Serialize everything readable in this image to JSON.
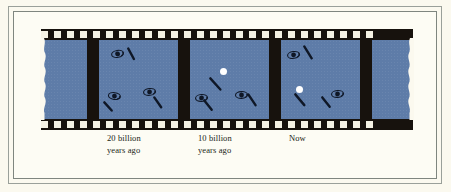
{
  "figure": {
    "background_color": "#fbf9ef",
    "border_color": "#7f867f",
    "film_color": "#17120d",
    "frame_color": "#5e7ca8",
    "sprocket_color": "#f5f2e4",
    "highlight_color": "#ffffff",
    "galaxy_color": "#0f1726",
    "type": "film-strip-illustration"
  },
  "captions": [
    {
      "id": "caption-20-billion",
      "text": "20 billion\nyears ago",
      "frame": 2
    },
    {
      "id": "caption-10-billion",
      "text": "10 billion\nyears ago",
      "frame": 3
    },
    {
      "id": "caption-now",
      "text": "Now",
      "frame": 4
    }
  ],
  "film": {
    "sprocket_count_top": 26,
    "sprocket_count_bottom": 26,
    "frame_count_visible": 4,
    "left_edge": "torn",
    "right_edge": "torn"
  },
  "frames": [
    {
      "index": 1,
      "label": "partial-left-frame",
      "objects": []
    },
    {
      "index": 2,
      "label": "20 billion years ago",
      "objects": [
        {
          "type": "spiral-galaxy",
          "x": 12,
          "y": 9,
          "rotation": -10
        },
        {
          "type": "motion-streak",
          "x": 29,
          "y": 6,
          "rotation": 62,
          "length": 13
        },
        {
          "type": "spiral-galaxy",
          "x": 9,
          "y": 51,
          "rotation": 8
        },
        {
          "type": "motion-streak",
          "x": 5,
          "y": 60,
          "rotation": 48,
          "length": 12
        },
        {
          "type": "spiral-galaxy",
          "x": 44,
          "y": 47,
          "rotation": -6
        },
        {
          "type": "motion-streak",
          "x": 55,
          "y": 55,
          "rotation": 55,
          "length": 13
        }
      ]
    },
    {
      "index": 3,
      "label": "10 billion years ago",
      "objects": [
        {
          "type": "bright-point",
          "x": 30,
          "y": 28
        },
        {
          "type": "motion-streak",
          "x": 20,
          "y": 36,
          "rotation": 48,
          "length": 16
        },
        {
          "type": "spiral-galaxy",
          "x": 5,
          "y": 53,
          "rotation": -4
        },
        {
          "type": "motion-streak",
          "x": 14,
          "y": 58,
          "rotation": 52,
          "length": 13
        },
        {
          "type": "spiral-galaxy",
          "x": 45,
          "y": 50,
          "rotation": -2
        },
        {
          "type": "motion-streak",
          "x": 58,
          "y": 52,
          "rotation": 56,
          "length": 14
        }
      ]
    },
    {
      "index": 4,
      "label": "Now",
      "objects": [
        {
          "type": "spiral-galaxy",
          "x": 6,
          "y": 10,
          "rotation": -8
        },
        {
          "type": "motion-streak",
          "x": 23,
          "y": 4,
          "rotation": 58,
          "length": 15
        },
        {
          "type": "bright-point",
          "x": 15,
          "y": 46
        },
        {
          "type": "motion-streak",
          "x": 14,
          "y": 52,
          "rotation": 50,
          "length": 15
        },
        {
          "type": "spiral-galaxy",
          "x": 50,
          "y": 49,
          "rotation": -5
        },
        {
          "type": "motion-streak",
          "x": 41,
          "y": 55,
          "rotation": 52,
          "length": 13
        }
      ]
    },
    {
      "index": 5,
      "label": "partial-right-frame",
      "objects": []
    }
  ]
}
